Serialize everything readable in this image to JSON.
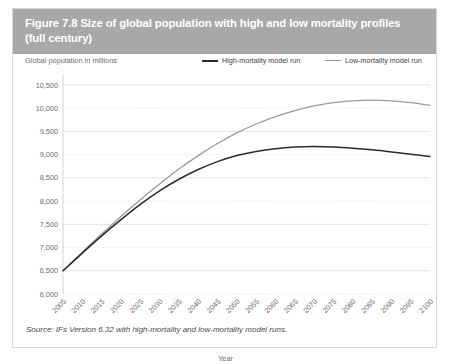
{
  "figure": {
    "title_line1": "Figure 7.8 Size of global population with high and low mortality profiles",
    "title_line2": "(full century)",
    "header_color": "#a8a8a8",
    "source": "Source: IFs Version 6.32 with high-mortality and low-mortality model runs."
  },
  "legend": {
    "axis_caption": "Global population in millions",
    "high_label": "High-mortality model run",
    "low_label": "Low-mortality model run",
    "high_color": "#2b2b2b",
    "low_color": "#9a9a9a"
  },
  "chart_data": {
    "type": "line",
    "title": "Figure 7.8 Size of global population with high and low mortality profiles (full century)",
    "xlabel": "Year",
    "ylabel": "Global population in millions",
    "ylim": [
      6000,
      10500
    ],
    "xlim": [
      2005,
      2100
    ],
    "grid": true,
    "legend_position": "top",
    "y_ticks": [
      "10,500",
      "10,000",
      "9,500",
      "9,000",
      "8,500",
      "8,000",
      "7,500",
      "7,000",
      "6,500",
      "6,000"
    ],
    "y_tick_values": [
      10500,
      10000,
      9500,
      9000,
      8500,
      8000,
      7500,
      7000,
      6500,
      6000
    ],
    "x_ticks": [
      "2005",
      "2010",
      "2015",
      "2020",
      "2025",
      "2030",
      "2035",
      "2040",
      "2045",
      "2050",
      "2055",
      "2060",
      "2065",
      "2070",
      "2075",
      "2080",
      "2085",
      "2090",
      "2095",
      "2100"
    ],
    "x": [
      2005,
      2010,
      2015,
      2020,
      2025,
      2030,
      2035,
      2040,
      2045,
      2050,
      2055,
      2060,
      2065,
      2070,
      2075,
      2080,
      2085,
      2090,
      2095,
      2100
    ],
    "series": [
      {
        "name": "High-mortality model run",
        "color": "#2b2b2b",
        "values": [
          6500,
          6880,
          7250,
          7600,
          7930,
          8220,
          8470,
          8680,
          8850,
          8980,
          9070,
          9130,
          9165,
          9175,
          9165,
          9140,
          9105,
          9060,
          9010,
          8960
        ]
      },
      {
        "name": "Low-mortality model run",
        "color": "#9a9a9a",
        "values": [
          6500,
          6900,
          7290,
          7670,
          8030,
          8370,
          8690,
          8980,
          9240,
          9470,
          9660,
          9820,
          9950,
          10050,
          10120,
          10160,
          10175,
          10160,
          10120,
          10060
        ]
      }
    ]
  }
}
